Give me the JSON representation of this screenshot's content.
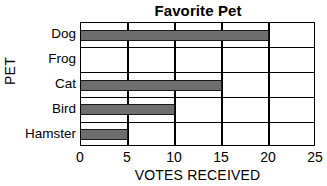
{
  "chart_data": {
    "type": "bar",
    "orientation": "horizontal",
    "title": "Favorite Pet",
    "xlabel": "VOTES RECEIVED",
    "ylabel": "PET",
    "categories": [
      "Dog",
      "Frog",
      "Cat",
      "Bird",
      "Hamster"
    ],
    "values": [
      20,
      0,
      15,
      10,
      5
    ],
    "xlim": [
      0,
      25
    ],
    "xticks": [
      0,
      5,
      10,
      15,
      20,
      25
    ],
    "xtick_labels": [
      "0",
      "5",
      "10",
      "15",
      "20",
      "25"
    ],
    "grid": "vertical-and-horizontal",
    "legend": "none",
    "bar_color": "#6e6e6e",
    "bar_edge_color": "#1a1a1a",
    "axis_color": "#000000",
    "background_color": "#ffffff"
  }
}
